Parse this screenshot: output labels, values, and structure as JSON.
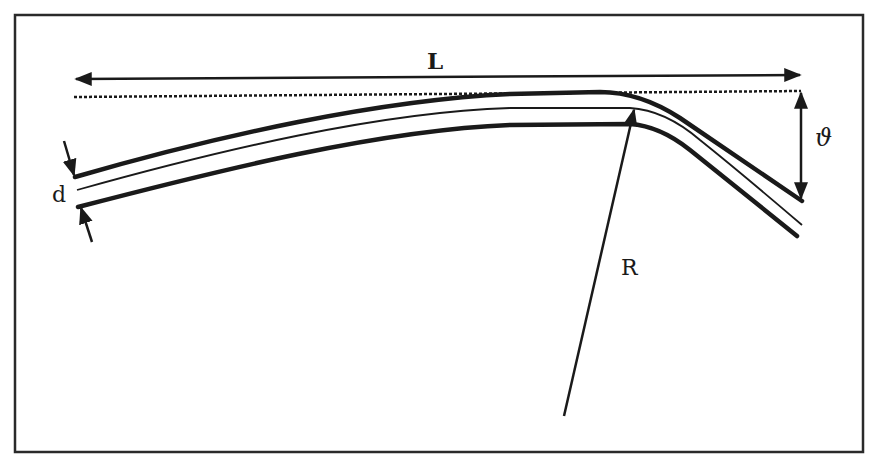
{
  "figure": {
    "type": "schematic",
    "frame": {
      "stroke_color": "#2a2a2a"
    },
    "ink_color": "#1a1a1a"
  },
  "labels": {
    "length": "L",
    "thickness": "d",
    "radius": "R",
    "angle": "ϑ"
  },
  "annotations": {
    "length_arrow": {
      "type": "double-headed horizontal arrow",
      "label_ref": "length"
    },
    "reference_line": {
      "type": "dashed horizontal tangent line"
    },
    "thickness_arrows": {
      "type": "pair of inward-pointing arrows",
      "label_ref": "thickness"
    },
    "radius_line": {
      "type": "arrow from bend center to fiber axis",
      "label_ref": "radius"
    },
    "angle_arrow": {
      "type": "double-headed vertical arrow",
      "label_ref": "angle"
    }
  }
}
